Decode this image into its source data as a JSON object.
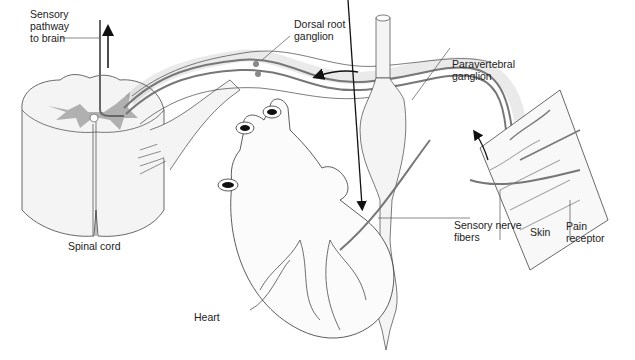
{
  "diagram": {
    "colors": {
      "line": "#333333",
      "gray_matter": "#a9a9a9",
      "nerve": "#777777",
      "fill_light": "#f2f2f2",
      "arrow": "#111111"
    },
    "labels": {
      "sensory_pathway": "Sensory\npathway\nto brain",
      "dorsal_root_ganglion": "Dorsal root\nganglion",
      "paravertebral_ganglion": "Paravertebral\nganglion",
      "sensory_nerve_fibers": "Sensory nerve\nfibers",
      "skin": "Skin",
      "pain_receptor": "Pain\nreceptor",
      "spinal_cord": "Spinal cord",
      "heart": "Heart"
    },
    "structures": [
      "spinal-cord",
      "dorsal-root-ganglion",
      "paravertebral-ganglion",
      "sympathetic-trunk",
      "heart",
      "skin",
      "pain-receptor",
      "sensory-nerve-fibers"
    ],
    "arrows": [
      {
        "name": "up-to-brain",
        "direction": "up"
      },
      {
        "name": "toward-spinal-cord",
        "direction": "left"
      },
      {
        "name": "from-skin",
        "direction": "up"
      },
      {
        "name": "from-heart",
        "direction": "up-right"
      }
    ]
  }
}
